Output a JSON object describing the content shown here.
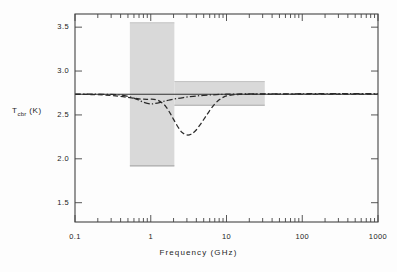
{
  "chart_data": {
    "type": "line",
    "title": "",
    "xlabel": "Frequency  (GHz)",
    "ylabel": "T_cbr (K)",
    "ylabel_base": "T",
    "ylabel_sub": "cbr",
    "ylabel_unit": "(K)",
    "xscale": "log",
    "yscale": "linear",
    "xlim": [
      0.1,
      1000
    ],
    "ylim": [
      1.28,
      3.65
    ],
    "xticks": [
      0.1,
      1,
      10,
      100,
      1000
    ],
    "xtick_labels": [
      "0.1",
      "1",
      "10",
      "100",
      "1000"
    ],
    "yticks": [
      1.5,
      2.0,
      2.5,
      3.0,
      3.5
    ],
    "ytick_labels": [
      "1.5",
      "2.0",
      "2.5",
      "3.0",
      "3.5"
    ],
    "grid": false,
    "legend": "none",
    "reference_line": {
      "name": "blackbody-baseline",
      "value": 2.735,
      "style": "solid",
      "color": "#303030"
    },
    "series": [
      {
        "name": "dashed-spectrum",
        "style": "dashed",
        "color": "#2a2a2a",
        "points": [
          [
            0.1,
            2.735
          ],
          [
            0.15,
            2.733
          ],
          [
            0.2,
            2.73
          ],
          [
            0.3,
            2.722
          ],
          [
            0.4,
            2.712
          ],
          [
            0.5,
            2.7
          ],
          [
            0.6,
            2.69
          ],
          [
            0.7,
            2.683
          ],
          [
            0.8,
            2.679
          ],
          [
            0.9,
            2.678
          ],
          [
            1.0,
            2.68
          ],
          [
            1.2,
            2.672
          ],
          [
            1.4,
            2.64
          ],
          [
            1.6,
            2.59
          ],
          [
            1.8,
            2.52
          ],
          [
            2.0,
            2.45
          ],
          [
            2.3,
            2.36
          ],
          [
            2.6,
            2.3
          ],
          [
            3.0,
            2.272
          ],
          [
            3.4,
            2.28
          ],
          [
            3.9,
            2.32
          ],
          [
            4.5,
            2.39
          ],
          [
            5.2,
            2.47
          ],
          [
            6.0,
            2.55
          ],
          [
            7.0,
            2.625
          ],
          [
            8.0,
            2.672
          ],
          [
            9.0,
            2.7
          ],
          [
            10.0,
            2.716
          ],
          [
            12.0,
            2.728
          ],
          [
            15.0,
            2.734
          ],
          [
            20.0,
            2.736
          ],
          [
            30.0,
            2.736
          ],
          [
            50.0,
            2.736
          ],
          [
            100.0,
            2.736
          ],
          [
            300.0,
            2.736
          ],
          [
            1000.0,
            2.736
          ]
        ]
      },
      {
        "name": "dash-dot-spectrum",
        "style": "dash-dot",
        "color": "#2a2a2a",
        "points": [
          [
            0.1,
            2.737
          ],
          [
            0.15,
            2.737
          ],
          [
            0.2,
            2.736
          ],
          [
            0.3,
            2.733
          ],
          [
            0.4,
            2.726
          ],
          [
            0.5,
            2.712
          ],
          [
            0.6,
            2.692
          ],
          [
            0.7,
            2.668
          ],
          [
            0.8,
            2.645
          ],
          [
            0.9,
            2.632
          ],
          [
            1.0,
            2.626
          ],
          [
            1.1,
            2.628
          ],
          [
            1.3,
            2.64
          ],
          [
            1.5,
            2.656
          ],
          [
            1.8,
            2.672
          ],
          [
            2.2,
            2.686
          ],
          [
            2.7,
            2.698
          ],
          [
            3.3,
            2.708
          ],
          [
            4.0,
            2.716
          ],
          [
            5.0,
            2.723
          ],
          [
            6.5,
            2.729
          ],
          [
            8.0,
            2.733
          ],
          [
            10.0,
            2.736
          ],
          [
            13.0,
            2.738
          ],
          [
            18.0,
            2.739
          ],
          [
            25.0,
            2.74
          ],
          [
            40.0,
            2.741
          ],
          [
            70.0,
            2.741
          ],
          [
            150.0,
            2.742
          ],
          [
            400.0,
            2.742
          ],
          [
            1000.0,
            2.742
          ]
        ]
      }
    ],
    "shaded_regions": [
      {
        "name": "low-frequency-uncertainty-band",
        "x_range": [
          0.53,
          2.05
        ],
        "y_range": [
          1.92,
          3.55
        ],
        "color": "#d9d9d9"
      },
      {
        "name": "mid-frequency-uncertainty-band",
        "x_range": [
          2.05,
          32.0
        ],
        "y_range": [
          2.61,
          2.88
        ],
        "color": "#d9d9d9"
      }
    ]
  },
  "axes": {
    "frame_color": "#444444",
    "tick_color": "#444444"
  }
}
